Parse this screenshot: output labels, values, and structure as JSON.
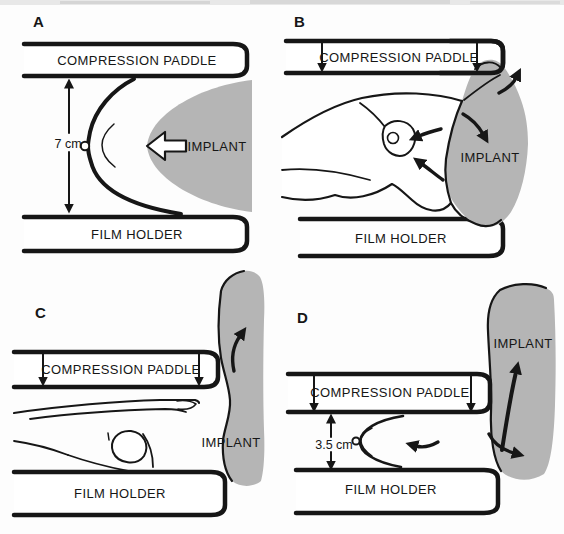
{
  "figure": {
    "colors": {
      "paper": "#fdfdfd",
      "ink": "#161616",
      "implant": "#b5b5b5"
    },
    "panels": {
      "a": {
        "label": "A",
        "paddle": "COMPRESSION PADDLE",
        "film": "FILM HOLDER",
        "implant": "IMPLANT",
        "measurement": "7 cm"
      },
      "b": {
        "label": "B",
        "paddle": "COMPRESSION PADDLE",
        "film": "FILM HOLDER",
        "implant": "IMPLANT"
      },
      "c": {
        "label": "C",
        "paddle": "COMPRESSION PADDLE",
        "film": "FILM HOLDER",
        "implant": "IMPLANT"
      },
      "d": {
        "label": "D",
        "paddle": "COMPRESSION PADDLE",
        "film": "FILM HOLDER",
        "implant": "IMPLANT",
        "measurement": "3.5 cm"
      }
    }
  }
}
